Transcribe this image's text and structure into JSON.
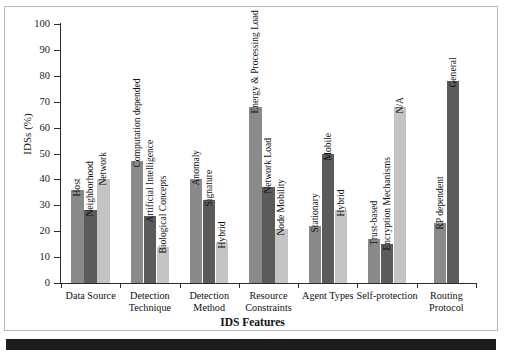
{
  "chart_data": {
    "type": "bar",
    "title": "",
    "xlabel": "IDS Features",
    "ylabel": "IDSs (%)",
    "ylim": [
      0,
      100
    ],
    "ytick_step": 10,
    "grid": false,
    "legend": "none",
    "bar_value_labels": "rotated text above each bar",
    "categories": [
      "Data Source",
      "Detection Technique",
      "Detection Method",
      "Resource Constraints",
      "Agent Types",
      "Self-protection",
      "Routing Protocol"
    ],
    "category_lines": [
      [
        "Data Source"
      ],
      [
        "Detection",
        "Technique"
      ],
      [
        "Detection",
        "Method"
      ],
      [
        "Resource",
        "Constraints"
      ],
      [
        "Agent Types"
      ],
      [
        "Self-protection"
      ],
      [
        "Routing",
        "Protocol"
      ]
    ],
    "yticks": [
      0,
      10,
      20,
      30,
      40,
      50,
      60,
      70,
      80,
      90,
      100
    ],
    "series_colors": [
      "#8a8a8a",
      "#5b5b5b",
      "#c4c4c4"
    ],
    "groups": [
      {
        "category": "Data Source",
        "bars": [
          {
            "label": "Host",
            "value": 36,
            "series": 0
          },
          {
            "label": "Neighborhood",
            "value": 28,
            "series": 1
          },
          {
            "label": "Network",
            "value": 40,
            "series": 2
          }
        ]
      },
      {
        "category": "Detection Technique",
        "bars": [
          {
            "label": "Computation depended",
            "value": 47,
            "series": 0
          },
          {
            "label": "Artificial Intelligence",
            "value": 26,
            "series": 1
          },
          {
            "label": "Biological Concepts",
            "value": 14,
            "series": 2
          }
        ]
      },
      {
        "category": "Detection Method",
        "bars": [
          {
            "label": "Anomaly",
            "value": 40,
            "series": 0
          },
          {
            "label": "Signature",
            "value": 32,
            "series": 1
          },
          {
            "label": "Hybrid",
            "value": 16,
            "series": 2
          }
        ]
      },
      {
        "category": "Resource Constraints",
        "bars": [
          {
            "label": "Energy & Processing Load",
            "value": 68,
            "series": 0
          },
          {
            "label": "Network Load",
            "value": 37,
            "series": 1
          },
          {
            "label": "Node Mobility",
            "value": 21,
            "series": 2
          }
        ]
      },
      {
        "category": "Agent Types",
        "bars": [
          {
            "label": "Stationary",
            "value": 22,
            "series": 0
          },
          {
            "label": "Mobile",
            "value": 50,
            "series": 1
          },
          {
            "label": "Hybrid",
            "value": 28,
            "series": 2
          }
        ]
      },
      {
        "category": "Self-protection",
        "bars": [
          {
            "label": "Trust-based",
            "value": 17,
            "series": 0
          },
          {
            "label": "Encryption Mechanisms",
            "value": 15,
            "series": 1
          },
          {
            "label": "N/A",
            "value": 68,
            "series": 2
          }
        ]
      },
      {
        "category": "Routing Protocol",
        "bars": [
          {
            "label": "RP dependent",
            "value": 23,
            "series": 0
          },
          {
            "label": "General",
            "value": 78,
            "series": 1
          }
        ]
      }
    ]
  }
}
